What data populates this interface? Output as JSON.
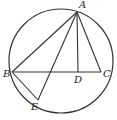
{
  "diagram": {
    "type": "geometry",
    "circle": {
      "cx": 61,
      "cy": 61,
      "r": 52
    },
    "points": {
      "A": {
        "x": 77,
        "y": 12
      },
      "B": {
        "x": 12,
        "y": 72
      },
      "C": {
        "x": 101,
        "y": 72
      },
      "D": {
        "x": 78,
        "y": 72
      },
      "E": {
        "x": 38,
        "y": 100
      }
    },
    "segments": [
      [
        "A",
        "B"
      ],
      [
        "A",
        "C"
      ],
      [
        "B",
        "C"
      ],
      [
        "A",
        "D"
      ],
      [
        "A",
        "E"
      ],
      [
        "B",
        "E"
      ]
    ],
    "labels": {
      "A": "A",
      "B": "B",
      "C": "C",
      "D": "D",
      "E": "E"
    },
    "stroke_color": "#333333"
  }
}
